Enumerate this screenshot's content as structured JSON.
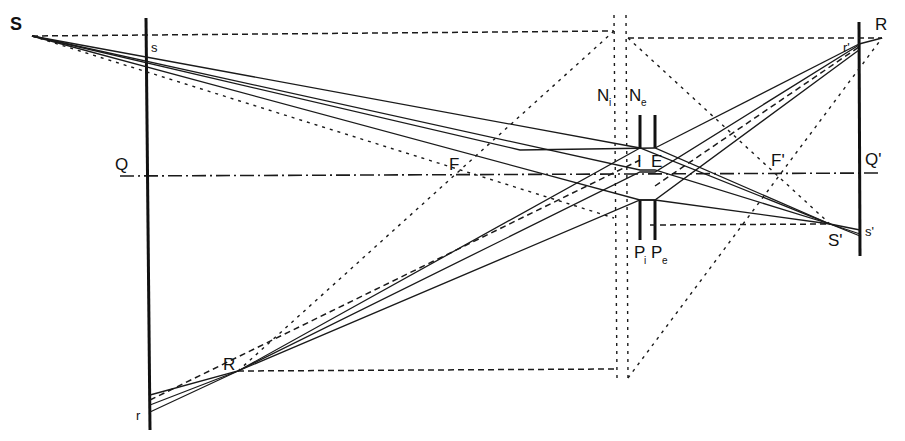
{
  "diagram": {
    "type": "geometric-optics ray diagram (thick lens / optical system with nodal and principal planes)",
    "labels": {
      "S": "S",
      "s": "s",
      "Q": "Q",
      "F": "F",
      "N_i": "N",
      "N_i_sub": "i",
      "N_e": "N",
      "N_e_sub": "e",
      "I": "I",
      "E": "E",
      "P_i": "P",
      "P_i_sub": "i",
      "P_e": "P",
      "P_e_sub": "e",
      "F_prime": "F'",
      "Q_prime": "Q'",
      "R": "R",
      "r_prime": "r'",
      "S_prime": "S'",
      "s_prime": "s'",
      "R_lower": "R",
      "r": "r"
    },
    "elements": [
      "object screen (left vertical line through Q)",
      "image screen (right vertical line through Q')",
      "optical axis (dash-dot line Q–Q')",
      "entrance pupil stop P_i with aperture at I",
      "exit pupil stop P_e with aperture at E",
      "nodal planes N_i and N_e (vertical dotted lines)",
      "focal points F and F'",
      "object point S, image point S'",
      "object point R (lower), image point R (upper right)"
    ]
  }
}
